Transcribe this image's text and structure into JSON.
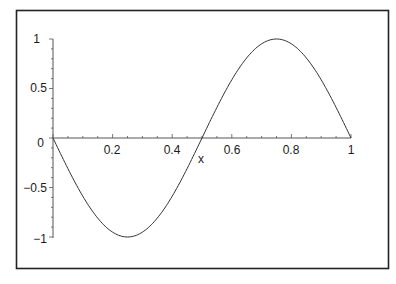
{
  "chart_data": {
    "type": "line",
    "title": "",
    "xlabel": "x",
    "ylabel": "",
    "xlim": [
      0,
      1
    ],
    "ylim": [
      -1,
      1
    ],
    "grid": false,
    "legend": null,
    "x_ticks": [
      "0.2",
      "0.4",
      "0.6",
      "0.8",
      "1"
    ],
    "y_ticks": [
      "1",
      "0.5",
      "0",
      "-0.5",
      "-1"
    ],
    "series": [
      {
        "name": "-sin(2*Pi*x)",
        "x": [
          0,
          0.05,
          0.1,
          0.15,
          0.2,
          0.25,
          0.3,
          0.35,
          0.4,
          0.45,
          0.5,
          0.55,
          0.6,
          0.65,
          0.7,
          0.75,
          0.8,
          0.85,
          0.9,
          0.95,
          1.0
        ],
        "values": [
          0,
          -0.309,
          -0.588,
          -0.809,
          -0.951,
          -1,
          -0.951,
          -0.809,
          -0.588,
          -0.309,
          0,
          0.309,
          0.588,
          0.809,
          0.951,
          1,
          0.951,
          0.809,
          0.588,
          0.309,
          0
        ],
        "color": "#333333"
      }
    ]
  },
  "axes": {
    "x_label": "x",
    "y_tick_labels": [
      "1",
      "0.5",
      "0",
      "−0.5",
      "−1"
    ],
    "x_tick_labels": [
      "0.2",
      "0.4",
      "0.6",
      "0.8",
      "1"
    ]
  }
}
